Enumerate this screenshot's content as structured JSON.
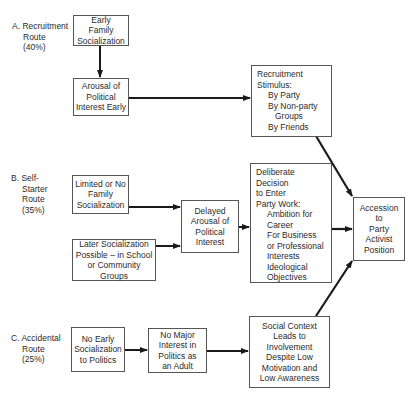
{
  "routes": {
    "a": {
      "lines": [
        "A. Recruitment",
        "Route",
        "(40%)"
      ]
    },
    "b": {
      "lines": [
        "B. Self-",
        "Starter",
        "Route",
        "(35%)"
      ]
    },
    "c": {
      "lines": [
        "C. Accidental",
        "Route",
        "(25%)"
      ]
    }
  },
  "boxes": {
    "early_family": {
      "lines": [
        "Early",
        "Family",
        "Socialization"
      ]
    },
    "arousal_early": {
      "lines": [
        "Arousal of",
        "Political",
        "Interest Early"
      ]
    },
    "recruitment_stimulus": {
      "heading": [
        "Recruitment",
        "Stimulus:"
      ],
      "items": [
        "By Party",
        "By Non-party",
        "Groups",
        "By Friends"
      ]
    },
    "limited_family": {
      "lines": [
        "Limited or No",
        "Family",
        "Socialization"
      ]
    },
    "later_socialization": {
      "lines": [
        "Later Socialization",
        "Possible – in School",
        "or Community Groups"
      ]
    },
    "delayed_arousal": {
      "lines": [
        "Delayed",
        "Arousal of",
        "Political",
        "Interest"
      ]
    },
    "deliberate_decision": {
      "heading": [
        "Deliberate Decision",
        "to Enter",
        "Party Work:"
      ],
      "items": [
        "Ambition for",
        "Career",
        "For Business",
        "or Professional",
        "Interests",
        "Ideological",
        "Objectives"
      ]
    },
    "accession": {
      "lines": [
        "Accession",
        "to",
        "Party",
        "Activist",
        "Position"
      ]
    },
    "no_early": {
      "lines": [
        "No Early",
        "Socialization",
        "to  Politics"
      ]
    },
    "no_major": {
      "lines": [
        "No Major",
        "Interest in",
        "Politics as",
        "an Adult"
      ]
    },
    "social_context": {
      "lines": [
        "Social Context",
        "Leads to Involvement",
        "Despite Low",
        "Motivation  and",
        "Low Awareness"
      ]
    }
  },
  "colors": {
    "line": "#1a1a1a",
    "border": "#555555",
    "text": "#2a2a2a",
    "background": "#ffffff"
  }
}
